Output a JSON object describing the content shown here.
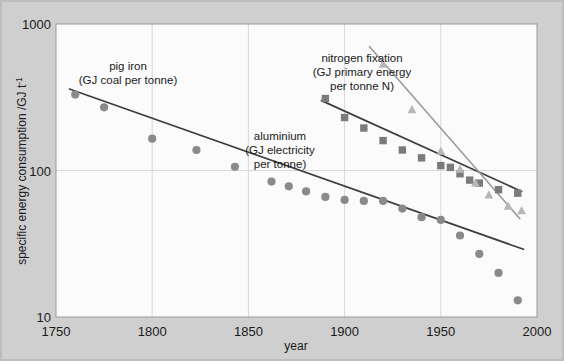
{
  "figure": {
    "background_color": "#cfcfcf",
    "plot_background_color": "#fbfbfb",
    "grid_color": "#d8d8d8",
    "axis_color": "#9a9a9a"
  },
  "chart_data": {
    "type": "scatter",
    "title": "",
    "xlabel": "year",
    "ylabel": "specific energy consumption /GJ t",
    "ylabel_exponent": "-1",
    "xlim": [
      1750,
      2000
    ],
    "ylim": [
      10,
      1000
    ],
    "yscale": "log",
    "xscale": "linear",
    "xticks": [
      "1750",
      "1800",
      "1850",
      "1900",
      "1950",
      "2000"
    ],
    "xtick_values": [
      1750,
      1800,
      1850,
      1900,
      1950,
      2000
    ],
    "yticks": [
      "1000",
      "100",
      "10"
    ],
    "ytick_values": [
      1000,
      100,
      10
    ],
    "grid": true,
    "legend_position": "inline-annotations",
    "series": [
      {
        "name": "pig iron",
        "annotation": [
          "pig iron",
          "(GJ coal per tonne)"
        ],
        "marker": "circle",
        "color": "#8a8a8a",
        "trend_color": "#3d3d3d",
        "x": [
          1760,
          1775,
          1800,
          1823,
          1843,
          1862,
          1871,
          1880,
          1890,
          1900,
          1910,
          1920,
          1930,
          1940,
          1950,
          1960,
          1970,
          1980,
          1990
        ],
        "y": [
          330,
          270,
          165,
          138,
          106,
          84,
          78,
          72,
          66,
          63,
          62,
          62,
          55,
          48,
          46,
          36,
          27,
          20,
          13
        ],
        "trend_x": [
          1757,
          1993
        ],
        "trend_y": [
          360,
          29
        ]
      },
      {
        "name": "aluminium",
        "annotation": [
          "aluminium",
          "(GJ electricity",
          "per tonne)"
        ],
        "marker": "square",
        "color": "#7b7b7b",
        "trend_color": "#3d3d3d",
        "x": [
          1890,
          1900,
          1910,
          1920,
          1930,
          1940,
          1950,
          1955,
          1960,
          1965,
          1970,
          1980,
          1990
        ],
        "y": [
          310,
          230,
          195,
          160,
          138,
          122,
          108,
          105,
          95,
          86,
          82,
          74,
          70
        ],
        "trend_x": [
          1888,
          1992
        ],
        "trend_y": [
          300,
          72
        ]
      },
      {
        "name": "nitrogen fixation",
        "annotation": [
          "nitrogen fixation",
          "(GJ primary energy",
          "per tonne N)"
        ],
        "marker": "triangle",
        "color": "#b6b6b6",
        "trend_color": "#9e9e9e",
        "x": [
          1920,
          1935,
          1950,
          1960,
          1968,
          1975,
          1985,
          1992
        ],
        "y": [
          530,
          260,
          135,
          102,
          82,
          68,
          57,
          53
        ],
        "trend_x": [
          1913,
          1991
        ],
        "trend_y": [
          700,
          47
        ]
      }
    ]
  },
  "annotations": {
    "pig_iron": {
      "lines": [
        "pig iron",
        "(GJ coal per tonne)"
      ],
      "x": 128,
      "y": 70
    },
    "aluminium": {
      "lines": [
        "aluminium",
        "(GJ electricity",
        "per tonne)"
      ],
      "x": 280,
      "y": 140
    },
    "nitrogen_fixation": {
      "lines": [
        "nitrogen fixation",
        "(GJ primary energy",
        "per tonne N)"
      ],
      "x": 362,
      "y": 62
    }
  },
  "axis": {
    "x_title": "year",
    "y_title_main": "specific energy consumption /GJ t",
    "y_title_sup": "-1",
    "x_tick_labels": [
      "1750",
      "1800",
      "1850",
      "1900",
      "1950",
      "2000"
    ],
    "y_tick_labels": [
      "1000",
      "100",
      "10"
    ]
  }
}
